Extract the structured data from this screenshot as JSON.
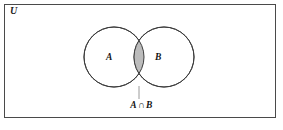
{
  "figure": {
    "type": "venn-diagram",
    "universe_label": "U",
    "caption": "A ∩ B",
    "caption_parts": {
      "left_set": "A",
      "operator": "∩",
      "right_set": "B"
    },
    "sets": [
      {
        "id": "A",
        "label": "A",
        "center_x": 114,
        "center_y": 57,
        "radius": 30
      },
      {
        "id": "B",
        "label": "B",
        "center_x": 164,
        "center_y": 57,
        "radius": 30
      }
    ],
    "shaded_region": {
      "name": "intersection",
      "label": "A ∩ B",
      "fill_color": "#bcbcbc",
      "stroke_color": "#3c3c3c"
    },
    "colors": {
      "frame_stroke": "#4a4a4a",
      "circle_stroke": "#3c3c3c",
      "circle_fill": "#ffffff",
      "shade_fill": "#bcbcbc",
      "leader_line": "#9a9a9a",
      "text": "#151515",
      "background": "#ffffff"
    },
    "frame": {
      "x": 4,
      "y": 4,
      "width": 272,
      "height": 114
    },
    "leader_line": {
      "x": 139,
      "y_top": 87,
      "y_bottom": 100
    }
  }
}
